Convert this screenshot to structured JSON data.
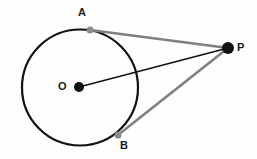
{
  "figure": {
    "width": 257,
    "height": 159,
    "background_color": "#fefefe"
  },
  "labels": {
    "center": "O",
    "tangent_point_upper": "A",
    "tangent_point_lower": "B",
    "external_point": "P"
  },
  "colors": {
    "circle_stroke": "#111111",
    "radius_line": "#111111",
    "tangent_line": "#808080",
    "point_fill": "#111111",
    "tangent_point_fill": "#8a8a8a",
    "label_text": "#1a1a1a"
  },
  "geometry": {
    "circle": {
      "cx": 80,
      "cy": 87.5,
      "r": 58,
      "stroke_width": 2.2
    },
    "points": {
      "O": {
        "x": 79,
        "y": 87,
        "dot_radius": 5
      },
      "A": {
        "x": 90,
        "y": 30,
        "dot_radius": 3.5
      },
      "B": {
        "x": 118,
        "y": 135,
        "dot_radius": 3.5
      },
      "P": {
        "x": 228,
        "y": 48,
        "dot_radius": 6
      }
    },
    "segments": [
      {
        "name": "radius-OP",
        "from": "O",
        "to": "P",
        "color": "#111111",
        "width": 1.6
      },
      {
        "name": "tangent-AP",
        "from": "A",
        "to": "P",
        "color": "#808080",
        "width": 2.6
      },
      {
        "name": "tangent-BP",
        "from": "B",
        "to": "P",
        "color": "#808080",
        "width": 2.6
      }
    ]
  }
}
